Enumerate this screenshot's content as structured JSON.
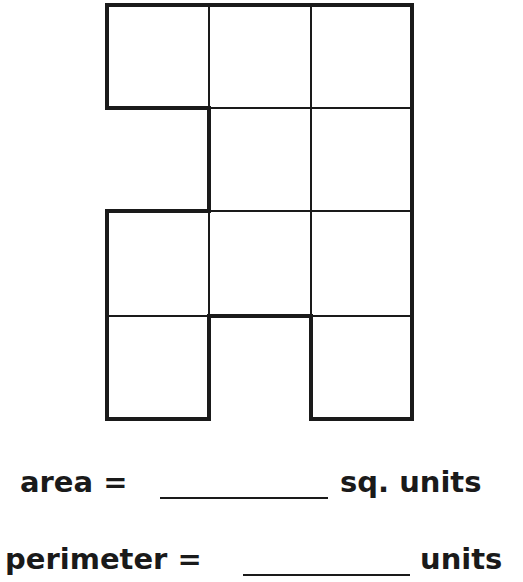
{
  "figure": {
    "grid": {
      "columns": 3,
      "rows": 4
    },
    "cells": [
      [
        1,
        1,
        1
      ],
      [
        0,
        1,
        1
      ],
      [
        1,
        1,
        1
      ],
      [
        1,
        0,
        1
      ]
    ],
    "unit_square_count": 10,
    "colors": {
      "outline": "#1a1a1a",
      "grid": "#1a1a1a",
      "fill": "#ffffff"
    }
  },
  "questions": {
    "area": {
      "label": "area =",
      "answer": "",
      "unit": "sq. units"
    },
    "perimeter": {
      "label": "perimeter =",
      "answer": "",
      "unit": "units"
    }
  }
}
